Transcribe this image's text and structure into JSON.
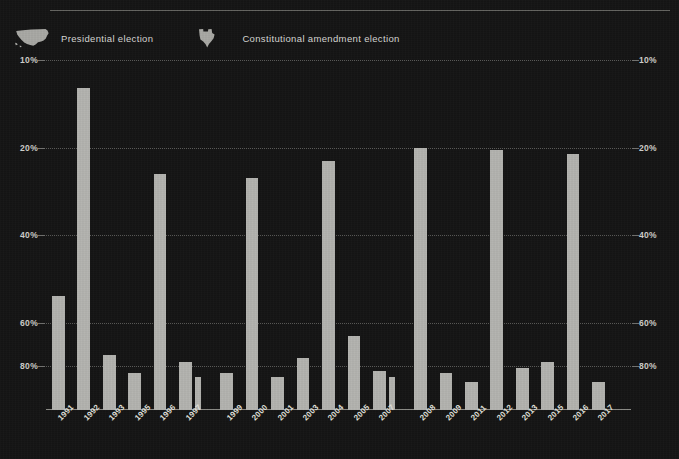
{
  "legend": {
    "items": [
      {
        "icon": "us-map-icon",
        "label": "Presidential election"
      },
      {
        "icon": "texas-map-icon",
        "label": "Constitutional amendment election"
      }
    ]
  },
  "axis": {
    "y_ticks_left": [
      "80%",
      "60%",
      "40%",
      "20%",
      "10%"
    ],
    "y_ticks_right": [
      "80%",
      "60%",
      "40%",
      "20%",
      "10%"
    ]
  },
  "colors": {
    "background": "#141414",
    "bar": "#b3b3af",
    "grid": "#bebeb9",
    "text": "#e2e2de",
    "rule": "#7d7d78"
  },
  "chart_data": {
    "type": "bar",
    "title": "",
    "xlabel": "",
    "ylabel": "",
    "ylim": [
      0,
      80
    ],
    "grid": true,
    "legend_position": "top-left",
    "ytick_values": [
      10,
      20,
      40,
      60,
      80
    ],
    "categories": [
      "1991",
      "1992",
      "1993",
      "1995",
      "1996",
      "1997",
      "1997b",
      "1999",
      "2000",
      "2001",
      "2003",
      "2004",
      "2005",
      "2007",
      "2007b",
      "2008",
      "2009",
      "2011",
      "2012",
      "2013",
      "2015",
      "2016",
      "2017"
    ],
    "tick_labels": [
      "1991",
      "1992",
      "1993",
      "1995",
      "1996",
      "1997",
      "1999",
      "2000",
      "2001",
      "2003",
      "2004",
      "2005",
      "2007",
      "2008",
      "2009",
      "2011",
      "2012",
      "2013",
      "2015",
      "2016",
      "2017"
    ],
    "series": [
      {
        "name": "Voter turnout",
        "values": [
          26.0,
          73.5,
          12.5,
          8.5,
          54.0,
          11.0,
          7.5,
          8.5,
          53.0,
          7.5,
          12.0,
          57.0,
          17.0,
          9.0,
          7.5,
          60.0,
          8.5,
          6.5,
          59.5,
          9.5,
          11.0,
          58.5,
          6.5
        ]
      }
    ],
    "annotations": [
      {
        "kind": "presidential",
        "years": [
          "1992",
          "1996",
          "2000",
          "2004",
          "2008",
          "2012",
          "2016"
        ]
      },
      {
        "kind": "constitutional-amendment",
        "years": [
          "1991",
          "1993",
          "1995",
          "1997",
          "1999",
          "2001",
          "2003",
          "2005",
          "2007",
          "2009",
          "2011",
          "2013",
          "2015",
          "2017"
        ]
      }
    ]
  }
}
